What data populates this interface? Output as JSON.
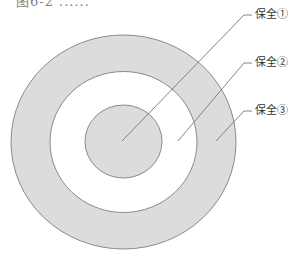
{
  "diagram": {
    "title_cut": "图6-2 ......",
    "type": "concentric-rings",
    "colors": {
      "fill": "#dcdcdc",
      "stroke": "#8a8a8a",
      "background": "#ffffff",
      "leader": "#777777"
    },
    "rings": [
      {
        "id": "ring-outer",
        "cx": 123.5,
        "cy": 142,
        "rx": 112.5,
        "ry": 107,
        "fill": "#dcdcdc"
      },
      {
        "id": "ring-middle",
        "cx": 123.5,
        "cy": 142,
        "rx": 73.5,
        "ry": 70.5,
        "fill": "#ffffff"
      },
      {
        "id": "ring-inner",
        "cx": 123.5,
        "cy": 141.5,
        "rx": 38.5,
        "ry": 36.5,
        "fill": "#dcdcdc"
      }
    ],
    "labels": [
      {
        "text": "保全①",
        "x": 255,
        "y": 9,
        "leader": {
          "x1": 252,
          "y1": 15,
          "x2": 244,
          "y2": 15,
          "x3": 122,
          "y3": 141
        }
      },
      {
        "text": "保全②",
        "x": 255,
        "y": 57,
        "leader": {
          "x1": 252,
          "y1": 63,
          "x2": 244,
          "y2": 63,
          "x3": 178,
          "y3": 141
        }
      },
      {
        "text": "保全③",
        "x": 255,
        "y": 105,
        "leader": {
          "x1": 252,
          "y1": 111,
          "x2": 244,
          "y2": 111,
          "x3": 216,
          "y3": 141
        }
      }
    ]
  }
}
